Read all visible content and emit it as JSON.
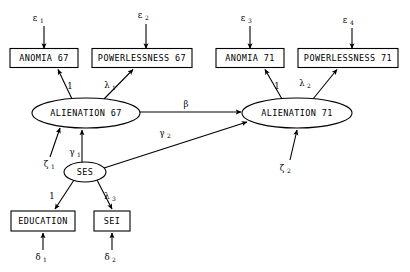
{
  "diagram": {
    "type": "path-diagram",
    "background_color": "#ffffff",
    "line_color": "#000000",
    "observed_variables": [
      {
        "id": "anomia67",
        "label": "ANOMIA 67",
        "x": 44,
        "y": 58,
        "w": 68,
        "h": 19
      },
      {
        "id": "powerlessness67",
        "label": "POWERLESSNESS 67",
        "x": 142,
        "y": 58,
        "w": 100,
        "h": 19
      },
      {
        "id": "anomia71",
        "label": "ANOMIA 71",
        "x": 250,
        "y": 58,
        "w": 68,
        "h": 19
      },
      {
        "id": "powerlessness71",
        "label": "POWERLESSNESS 71",
        "x": 348,
        "y": 58,
        "w": 100,
        "h": 19
      },
      {
        "id": "education",
        "label": "EDUCATION",
        "x": 43,
        "y": 221,
        "w": 64,
        "h": 20
      },
      {
        "id": "sei",
        "label": "SEI",
        "x": 112,
        "y": 221,
        "w": 36,
        "h": 20
      }
    ],
    "latent_variables": [
      {
        "id": "alienation67",
        "label": "ALIENATION 67",
        "cx": 86,
        "cy": 113,
        "rx": 54,
        "ry": 15
      },
      {
        "id": "alienation71",
        "label": "ALIENATION 71",
        "cx": 297,
        "cy": 113,
        "rx": 55,
        "ry": 15
      },
      {
        "id": "ses",
        "label": "SES",
        "cx": 85,
        "cy": 172,
        "rx": 21,
        "ry": 10
      }
    ],
    "error_terms": [
      {
        "id": "epsilon1",
        "symbol": "ε",
        "subscript": "1",
        "x": 35,
        "y": 18
      },
      {
        "id": "epsilon2",
        "symbol": "ε",
        "subscript": "2",
        "x": 140,
        "y": 15
      },
      {
        "id": "epsilon3",
        "symbol": "ε",
        "subscript": "3",
        "x": 243,
        "y": 18
      },
      {
        "id": "epsilon4",
        "symbol": "ε",
        "subscript": "4",
        "x": 350,
        "y": 20
      },
      {
        "id": "delta1",
        "symbol": "δ",
        "subscript": "1",
        "x": 43,
        "y": 258
      },
      {
        "id": "delta2",
        "symbol": "δ",
        "subscript": "2",
        "x": 112,
        "y": 258
      },
      {
        "id": "zeta1",
        "symbol": "ζ",
        "subscript": "1",
        "x": 50,
        "y": 163
      },
      {
        "id": "zeta2",
        "symbol": "ζ",
        "subscript": "2",
        "x": 283,
        "y": 168
      }
    ],
    "path_coefficients": [
      {
        "id": "load-anomia67",
        "symbol": "1",
        "subscript": "",
        "x": 70,
        "y": 86,
        "from": "alienation67",
        "to": "anomia67"
      },
      {
        "id": "load-power67",
        "symbol": "λ",
        "subscript": "1",
        "x": 111,
        "y": 85,
        "from": "alienation67",
        "to": "powerlessness67"
      },
      {
        "id": "load-anomia71",
        "symbol": "1",
        "subscript": "",
        "x": 277,
        "y": 86,
        "from": "alienation71",
        "to": "anomia71"
      },
      {
        "id": "load-power71",
        "symbol": "λ",
        "subscript": "2",
        "x": 306,
        "y": 83,
        "from": "alienation71",
        "to": "powerlessness71"
      },
      {
        "id": "beta",
        "symbol": "β",
        "subscript": "",
        "x": 186,
        "y": 104,
        "from": "alienation67",
        "to": "alienation71"
      },
      {
        "id": "gamma1",
        "symbol": "γ",
        "subscript": "1",
        "x": 76,
        "y": 152,
        "from": "ses",
        "to": "alienation67"
      },
      {
        "id": "gamma2",
        "symbol": "γ",
        "subscript": "2",
        "x": 166,
        "y": 133,
        "from": "ses",
        "to": "alienation71"
      },
      {
        "id": "load-education",
        "symbol": "1",
        "subscript": "",
        "x": 52,
        "y": 196,
        "from": "ses",
        "to": "education"
      },
      {
        "id": "load-sei",
        "symbol": "λ",
        "subscript": "3",
        "x": 111,
        "y": 196,
        "from": "ses",
        "to": "sei"
      }
    ]
  }
}
